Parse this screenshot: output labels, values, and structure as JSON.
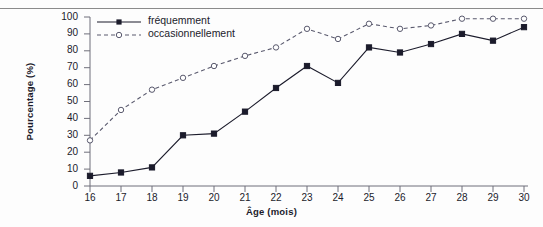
{
  "chart_data": {
    "type": "line",
    "title": "",
    "xlabel": "Âge (mois)",
    "ylabel": "Pourcentage (%)",
    "x": [
      16,
      17,
      18,
      19,
      20,
      21,
      22,
      23,
      24,
      25,
      26,
      27,
      28,
      29,
      30
    ],
    "xtick_labels": [
      "16",
      "17",
      "18",
      "19",
      "20",
      "21",
      "22",
      "23",
      "24",
      "25",
      "26",
      "27",
      "28",
      "29",
      "30"
    ],
    "ytick_labels": [
      "0",
      "10",
      "20",
      "30",
      "40",
      "50",
      "60",
      "70",
      "80",
      "90",
      "100"
    ],
    "ylim": [
      0,
      100
    ],
    "xlim": [
      16,
      30
    ],
    "grid": false,
    "legend_position": "top-left",
    "series": [
      {
        "name": "fréquemment",
        "marker": "filled-square",
        "line": "solid",
        "color": "#1b1b2b",
        "values": [
          6,
          8,
          11,
          30,
          31,
          44,
          58,
          71,
          61,
          82,
          79,
          84,
          90,
          86,
          94
        ]
      },
      {
        "name": "occasionnellement",
        "marker": "open-circle",
        "line": "dashed",
        "color": "#5a5a6e",
        "values": [
          27,
          45,
          57,
          64,
          71,
          77,
          82,
          93,
          87,
          96,
          93,
          95,
          99,
          99,
          99
        ]
      }
    ]
  }
}
